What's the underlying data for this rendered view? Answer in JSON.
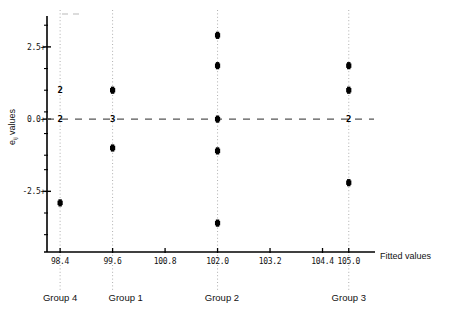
{
  "chart_data": {
    "type": "scatter",
    "title": "",
    "xlabel": "Fitted values",
    "ylabel": "e ij values",
    "ylabel_main": "e",
    "ylabel_sub": "ij",
    "ylabel_suffix": " values",
    "xlim": [
      98.1,
      105.6
    ],
    "ylim": [
      -4.6,
      3.5
    ],
    "xticks": [
      98.4,
      99.6,
      100.8,
      102.0,
      103.2,
      104.4,
      105.0
    ],
    "xtick_labels": [
      "98.4",
      "99.6",
      "100.8",
      "102.0",
      "103.2",
      "104.4",
      "105.0"
    ],
    "yticks": [
      2.5,
      0.0,
      -2.5
    ],
    "ytick_labels": [
      "2.5+",
      "0.0+",
      "-2.5+"
    ],
    "yminor": [
      3.25,
      1.75,
      1.0,
      0.25,
      -0.5,
      -1.25,
      -1.75,
      -3.25,
      -4.0
    ],
    "grid": "vertical-dotted-at-groups",
    "zero_line": {
      "value": 0.0,
      "style": "dashed"
    },
    "legend": "none",
    "groups": [
      {
        "name": "Group 4",
        "x": 98.4,
        "label_x": 98.4
      },
      {
        "name": "Group 1",
        "x": 99.6,
        "label_x": 99.9
      },
      {
        "name": "Group 2",
        "x": 102.0,
        "label_x": 102.1
      },
      {
        "name": "Group 3",
        "x": 105.0,
        "label_x": 105.0
      }
    ],
    "series": [
      {
        "name": "Group 4",
        "x": 98.4,
        "points": [
          {
            "y": 1.0,
            "count": 2,
            "marker": "count"
          },
          {
            "y": 0.0,
            "count": 2,
            "marker": "count"
          },
          {
            "y": -2.9,
            "count": 1,
            "marker": "dot"
          }
        ]
      },
      {
        "name": "Group 1",
        "x": 99.6,
        "points": [
          {
            "y": 1.0,
            "count": 1,
            "marker": "dot"
          },
          {
            "y": 0.0,
            "count": 3,
            "marker": "count"
          },
          {
            "y": -1.0,
            "count": 1,
            "marker": "dot"
          }
        ]
      },
      {
        "name": "Group 2",
        "x": 102.0,
        "points": [
          {
            "y": 2.9,
            "count": 1,
            "marker": "dot"
          },
          {
            "y": 1.85,
            "count": 1,
            "marker": "dot"
          },
          {
            "y": 0.0,
            "count": 1,
            "marker": "dot"
          },
          {
            "y": -1.1,
            "count": 1,
            "marker": "dot"
          },
          {
            "y": -3.6,
            "count": 1,
            "marker": "dot"
          }
        ]
      },
      {
        "name": "Group 3",
        "x": 105.0,
        "points": [
          {
            "y": 1.85,
            "count": 1,
            "marker": "dot"
          },
          {
            "y": 1.0,
            "count": 1,
            "marker": "dot"
          },
          {
            "y": 0.0,
            "count": 2,
            "marker": "count"
          },
          {
            "y": -2.2,
            "count": 1,
            "marker": "dot"
          }
        ]
      }
    ]
  }
}
